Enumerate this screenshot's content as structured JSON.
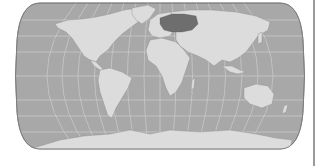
{
  "map": {
    "projection": "natural-earth",
    "style": "grayscale",
    "colors": {
      "background": "#ffffff",
      "ocean": "#a8a8a8",
      "land": "#dcdcdc",
      "land_highlight": "#6e6e6e",
      "graticule": "#d8d8d8",
      "outline": "#7a7a7a",
      "edge_line": "#9a9a9a"
    },
    "highlighted_region": "Eastern Europe / Western Russia",
    "graticule": true
  }
}
